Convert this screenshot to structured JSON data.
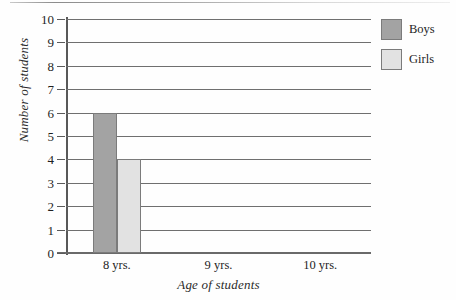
{
  "chart_data": {
    "type": "bar",
    "title": "",
    "subtitle": "",
    "xlabel": "Age of students",
    "ylabel": "Number of students",
    "categories": [
      "8 yrs.",
      "9 yrs.",
      "10 yrs."
    ],
    "series": [
      {
        "name": "Boys",
        "values": [
          6,
          0,
          0
        ],
        "color": "#a3a3a3"
      },
      {
        "name": "Girls",
        "values": [
          4,
          0,
          0
        ],
        "color": "#e2e2e2"
      }
    ],
    "ylim": [
      0,
      10
    ],
    "ytick_labels": [
      "0",
      "1",
      "2",
      "3",
      "4",
      "5",
      "6",
      "7",
      "8",
      "9",
      "10"
    ],
    "ytick_values": [
      0,
      1,
      2,
      3,
      4,
      5,
      6,
      7,
      8,
      9,
      10
    ],
    "grid": true,
    "grid_axis": "y",
    "legend_position": "top-right",
    "annotations": []
  },
  "legend": {
    "entries": [
      {
        "label": "Boys",
        "swatch_color": "#a3a3a3"
      },
      {
        "label": "Girls",
        "swatch_color": "#e2e2e2"
      }
    ]
  },
  "axes": {
    "x_title": "Age of students",
    "y_title": "Number of students"
  }
}
